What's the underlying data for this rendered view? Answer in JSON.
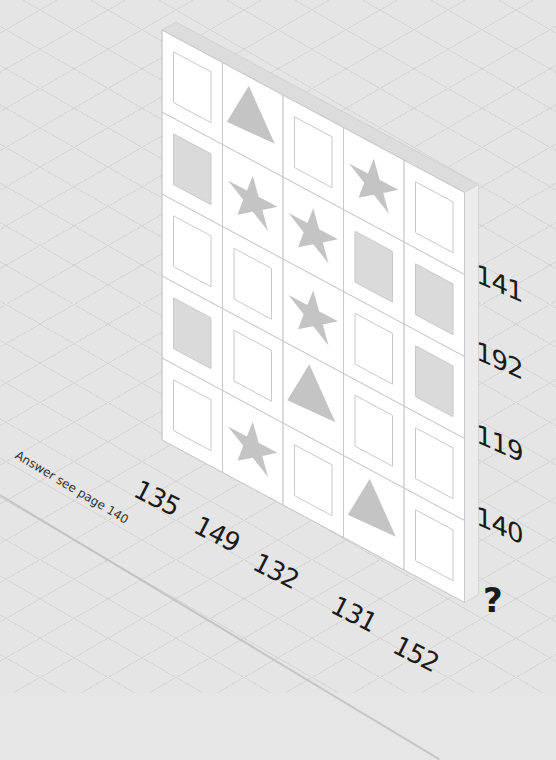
{
  "puzzle": {
    "grid": [
      [
        "blank",
        "triangle",
        "blank",
        "star",
        "blank"
      ],
      [
        "grey",
        "star",
        "star",
        "grey",
        "grey"
      ],
      [
        "blank",
        "blank",
        "star",
        "blank",
        "grey"
      ],
      [
        "grey",
        "blank",
        "triangle",
        "blank",
        "blank"
      ],
      [
        "blank",
        "star",
        "blank",
        "triangle",
        "blank"
      ]
    ],
    "row_totals": [
      "141",
      "192",
      "119",
      "140",
      "?"
    ],
    "column_totals": [
      "135",
      "149",
      "132",
      "131",
      "152"
    ],
    "answer_note": "Answer see page 140"
  },
  "colors": {
    "background": "#e5e5e5",
    "board_face": "#ffffff",
    "board_top": "#dcdcdc",
    "board_side": "#ececec",
    "shape_fill": "#c4c4c4",
    "grey_square": "#dadada",
    "line": "#c8c8c8",
    "text": "#1a1a1a"
  },
  "icons": {
    "star": "star-icon",
    "triangle": "triangle-icon",
    "grey": "grey-square-icon",
    "blank": "blank-square-icon"
  }
}
